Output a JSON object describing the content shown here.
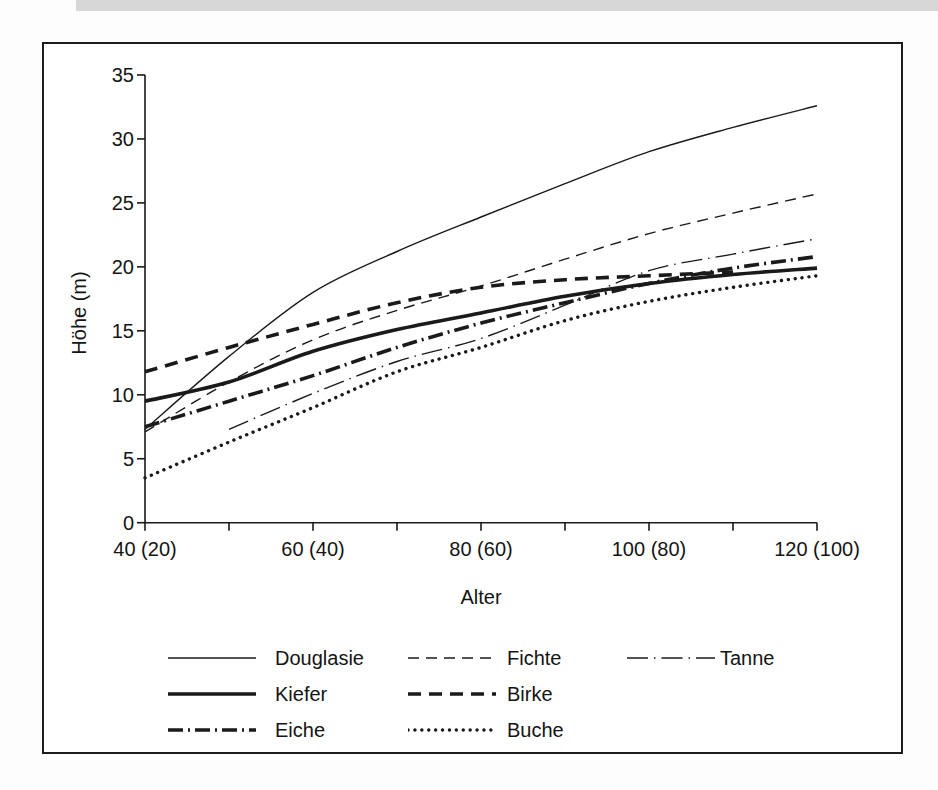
{
  "chart_data": {
    "type": "line",
    "title": "",
    "xlabel": "Alter",
    "ylabel": "Höhe (m)",
    "xlim": [
      40,
      120
    ],
    "ylim": [
      0,
      35
    ],
    "grid": false,
    "legend_position": "bottom",
    "y_ticks": [
      0,
      5,
      10,
      15,
      20,
      25,
      30,
      35
    ],
    "x_ticks_labeled": [
      {
        "value": 40,
        "label": "40 (20)"
      },
      {
        "value": 60,
        "label": "60 (40)"
      },
      {
        "value": 80,
        "label": "80 (60)"
      },
      {
        "value": 100,
        "label": "100 (80)"
      },
      {
        "value": 120,
        "label": "120 (100)"
      }
    ],
    "x_ticks_unlabeled": [
      50,
      70,
      90,
      110
    ],
    "line_color": "#1a1a1a",
    "series": [
      {
        "name": "Douglasie",
        "line": "solid",
        "weight": "thin",
        "x": [
          40,
          50,
          60,
          70,
          80,
          90,
          100,
          110,
          120
        ],
        "values": [
          7.3,
          13.0,
          18.0,
          21.2,
          23.9,
          26.5,
          29.0,
          30.9,
          32.6
        ]
      },
      {
        "name": "Fichte",
        "line": "dash",
        "weight": "thin",
        "x": [
          40,
          50,
          60,
          70,
          80,
          90,
          100,
          110,
          120
        ],
        "values": [
          7.1,
          11.0,
          14.3,
          16.6,
          18.5,
          20.6,
          22.6,
          24.2,
          25.7
        ]
      },
      {
        "name": "Tanne",
        "line": "dash-dot",
        "weight": "thin",
        "x": [
          50,
          60,
          70,
          80,
          90,
          100,
          110,
          120
        ],
        "values": [
          7.3,
          10.1,
          12.6,
          14.4,
          17.0,
          19.7,
          21.0,
          22.2
        ]
      },
      {
        "name": "Kiefer",
        "line": "solid",
        "weight": "thick",
        "x": [
          40,
          50,
          60,
          70,
          80,
          90,
          100,
          110,
          120
        ],
        "values": [
          9.5,
          11.0,
          13.4,
          15.1,
          16.4,
          17.7,
          18.7,
          19.4,
          19.9
        ]
      },
      {
        "name": "Birke",
        "line": "dash",
        "weight": "thick",
        "x": [
          40,
          50,
          60,
          70,
          80,
          90,
          100,
          110
        ],
        "values": [
          11.8,
          13.7,
          15.5,
          17.2,
          18.4,
          19.0,
          19.3,
          19.6
        ]
      },
      {
        "name": "Eiche",
        "line": "dash-dot",
        "weight": "thick",
        "x": [
          40,
          50,
          60,
          70,
          80,
          90,
          100,
          110,
          120
        ],
        "values": [
          7.5,
          9.5,
          11.5,
          13.7,
          15.6,
          17.2,
          18.7,
          19.9,
          20.8
        ]
      },
      {
        "name": "Buche",
        "line": "dot",
        "weight": "thick",
        "x": [
          40,
          50,
          60,
          70,
          80,
          90,
          100,
          110,
          120
        ],
        "values": [
          3.5,
          6.3,
          9.0,
          11.8,
          13.7,
          15.8,
          17.3,
          18.4,
          19.3
        ]
      }
    ],
    "legend_rows": [
      [
        "Douglasie",
        "Fichte",
        "Tanne"
      ],
      [
        "Kiefer",
        "Birke"
      ],
      [
        "Eiche",
        "Buche"
      ]
    ]
  }
}
